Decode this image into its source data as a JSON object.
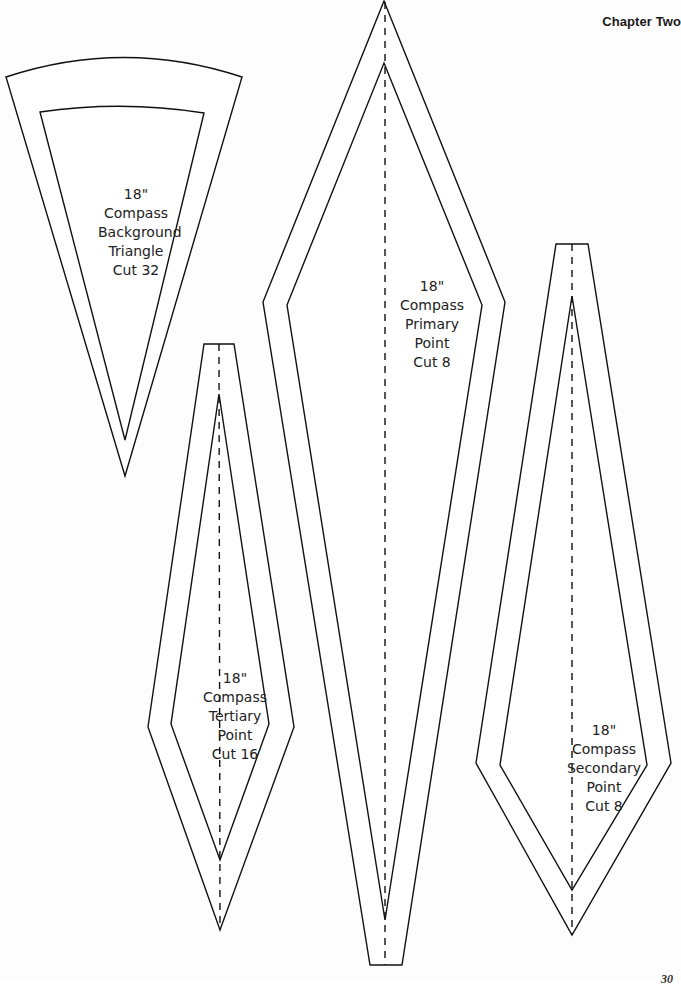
{
  "header": {
    "chapter": "Chapter Two"
  },
  "pieces": [
    {
      "id": "background-triangle",
      "lines": [
        "18\"",
        "Compass",
        "Background",
        "Triangle",
        "Cut 32"
      ]
    },
    {
      "id": "primary-point",
      "lines": [
        "18\"",
        "Compass",
        "Primary",
        "Point",
        "Cut 8"
      ]
    },
    {
      "id": "secondary-point",
      "lines": [
        "18\"",
        "Compass",
        "Secondary",
        "Point",
        "Cut 8"
      ]
    },
    {
      "id": "tertiary-point",
      "lines": [
        "18\"",
        "Compass",
        "Tertiary",
        "Point",
        "Cut 16"
      ]
    }
  ],
  "footer": {
    "page_number": "30"
  },
  "colors": {
    "line": "#111111",
    "background": "#fdfdfd",
    "fill": "#ffffff"
  }
}
